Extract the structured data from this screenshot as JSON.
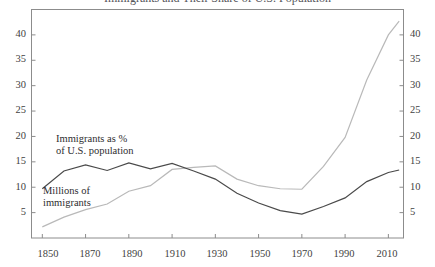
{
  "chart": {
    "title": "Immigrants and Their Share of U.S. Population",
    "xlabel": "",
    "ylabel_left": "",
    "ylabel_right": ""
  },
  "annotations": {
    "percent_line1": "Immigrants as %",
    "percent_line2": "of U.S. population",
    "millions_line1": "Millions of",
    "millions_line2": "immigrants"
  },
  "axis": {
    "y_ticks": [
      "5",
      "10",
      "15",
      "20",
      "25",
      "30",
      "35",
      "40"
    ],
    "x_ticks": [
      "1850",
      "1870",
      "1890",
      "1910",
      "1930",
      "1950",
      "1970",
      "1990",
      "2010"
    ]
  },
  "colors": {
    "percent_series": "#4a4a4a",
    "millions_series": "#b9b9b9",
    "frame": "#8c8c8c",
    "text": "#3a3a3a"
  },
  "chart_data": {
    "type": "line",
    "title": "Immigrants and Their Share of U.S. Population",
    "xlabel": "",
    "ylabel": "",
    "xlim": [
      1845,
      2017
    ],
    "ylim": [
      0,
      45
    ],
    "grid": false,
    "legend": "annotated-inline",
    "dual_axis": true,
    "x_tick_values": [
      1850,
      1870,
      1890,
      1910,
      1930,
      1950,
      1970,
      1990,
      2010
    ],
    "y_tick_values": [
      5,
      10,
      15,
      20,
      25,
      30,
      35,
      40
    ],
    "x": [
      1850,
      1860,
      1870,
      1880,
      1890,
      1900,
      1910,
      1920,
      1930,
      1940,
      1950,
      1960,
      1970,
      1980,
      1990,
      2000,
      2010,
      2015
    ],
    "series": [
      {
        "name": "Immigrants as % of U.S. population",
        "axis": "both",
        "unit": "percent",
        "color": "#4a4a4a",
        "values": [
          9.7,
          13.2,
          14.4,
          13.3,
          14.8,
          13.6,
          14.7,
          13.2,
          11.6,
          8.8,
          6.9,
          5.4,
          4.7,
          6.2,
          7.9,
          11.1,
          12.9,
          13.4
        ]
      },
      {
        "name": "Millions of immigrants",
        "axis": "both",
        "unit": "millions",
        "color": "#b9b9b9",
        "values": [
          2.2,
          4.1,
          5.6,
          6.7,
          9.2,
          10.3,
          13.5,
          13.9,
          14.2,
          11.6,
          10.3,
          9.7,
          9.6,
          14.1,
          19.8,
          31.1,
          40.0,
          42.7
        ]
      }
    ]
  }
}
